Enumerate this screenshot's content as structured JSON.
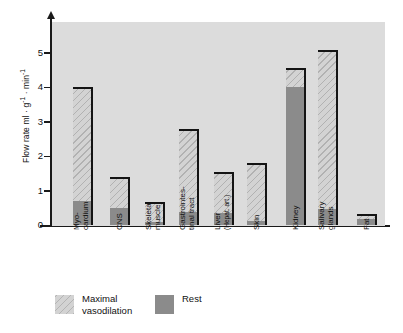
{
  "chart_data": {
    "type": "bar",
    "title": "",
    "subtitle": "",
    "xlabel": "",
    "ylabel": "Flow rate ml · g⁻¹ · min⁻¹",
    "ylabel_parts": {
      "prefix": "Flow rate ml · g",
      "exp1": "-1",
      "middle": " · min",
      "exp2": "-1"
    },
    "ylim": [
      0,
      5.6
    ],
    "yticks": [
      0,
      1,
      2,
      3,
      4,
      5
    ],
    "ytick_labels": [
      "0",
      "1",
      "2",
      "3",
      "4",
      "5"
    ],
    "grid": false,
    "legend_position": "bottom-left",
    "categories": [
      "Myo-\ncardium",
      "CNS",
      "Skeletal\nmuscle",
      "Gastrointes-\ntinal tract",
      "Liver\n(Hepat. art.)",
      "Skin",
      "Kidney",
      "Salivary\nglands",
      "Fat"
    ],
    "series": [
      {
        "name": "Maximal vasodilation",
        "color": "#d3d3d3",
        "values": [
          4.0,
          1.4,
          0.67,
          2.8,
          1.55,
          1.82,
          4.55,
          5.08,
          0.34
        ]
      },
      {
        "name": "Rest",
        "color": "#8b8b8b",
        "values": [
          0.7,
          0.5,
          0.1,
          0.4,
          0.35,
          0.13,
          4.0,
          0.48,
          0.2
        ]
      }
    ],
    "plot_background": "#dcdcdc",
    "axis_color": "#1a1a1a",
    "bar_outline_color": "#141414"
  },
  "categories_display": [
    {
      "line1": "Myo-",
      "line2": "cardium"
    },
    {
      "line1": "CNS",
      "line2": ""
    },
    {
      "line1": "Skeletal",
      "line2": "muscle"
    },
    {
      "line1": "Gastrointes-",
      "line2": "tinal tract"
    },
    {
      "line1": "Liver",
      "line2": "(Hepat. art.)"
    },
    {
      "line1": "Skin",
      "line2": ""
    },
    {
      "line1": "Kidney",
      "line2": ""
    },
    {
      "line1": "Salivary",
      "line2": "glands"
    },
    {
      "line1": "Fat",
      "line2": ""
    }
  ],
  "legend": {
    "items": [
      {
        "label": "Maximal\nvasodilation",
        "swatch": "light"
      },
      {
        "label": "Rest",
        "swatch": "dark"
      }
    ]
  }
}
